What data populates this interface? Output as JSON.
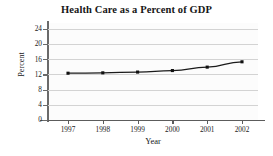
{
  "chart_data": {
    "type": "line",
    "title": "Health Care as a Percent of GDP",
    "xlabel": "Year",
    "ylabel": "Percent",
    "categories": [
      "1997",
      "1998",
      "1999",
      "2000",
      "2001",
      "2002"
    ],
    "x": [
      1997,
      1998,
      1999,
      2000,
      2001,
      2002
    ],
    "values": [
      12.3,
      12.4,
      12.6,
      13.0,
      13.9,
      15.3
    ],
    "series": [
      {
        "name": "Health Care as a Percent of GDP",
        "values": [
          12.3,
          12.4,
          12.6,
          13.0,
          13.9,
          15.3
        ]
      }
    ],
    "ylim": [
      0,
      25.5
    ],
    "yticks": [
      0,
      4,
      8,
      12,
      16,
      20,
      24
    ],
    "ytick_labels": [
      "0",
      "4",
      "8",
      "12",
      "16",
      "20",
      "24"
    ],
    "xtick_labels": [
      "1997",
      "1998",
      "1999",
      "2000",
      "2001",
      "2002"
    ],
    "grid": true,
    "grid_axis": "y",
    "legend": false,
    "legend_position": "none",
    "marker": "square",
    "line_color": "#1b1b1b",
    "marker_color": "#111111",
    "grid_color": "#d3d3d3",
    "plot_background": "#fcfcfc",
    "page_background": "#ffffff"
  }
}
